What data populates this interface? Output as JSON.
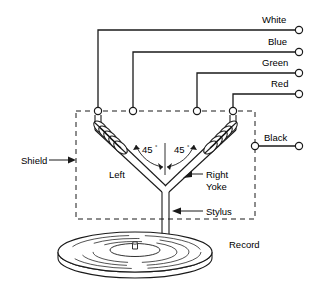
{
  "diagram": {
    "stroke_color": "#1a1a1a",
    "background_color": "#ffffff",
    "terminals": [
      {
        "name": "white-terminal",
        "label": "White",
        "label_x": 262,
        "label_y": 19,
        "wire_y": 30,
        "circle_x": 299,
        "tap_x": 98,
        "tap_y": 111
      },
      {
        "name": "blue-terminal",
        "label": "Blue",
        "label_x": 268,
        "label_y": 41,
        "wire_y": 52,
        "circle_x": 299,
        "tap_x": 133,
        "tap_y": 111
      },
      {
        "name": "green-terminal",
        "label": "Green",
        "label_x": 262,
        "label_y": 62,
        "wire_y": 73,
        "circle_x": 299,
        "tap_x": 197,
        "tap_y": 111
      },
      {
        "name": "red-terminal",
        "label": "Red",
        "label_x": 271,
        "label_y": 84,
        "wire_y": 94,
        "circle_x": 299,
        "tap_x": 233,
        "tap_y": 111
      },
      {
        "name": "black-terminal",
        "label": "Black",
        "label_x": 264,
        "label_y": 139,
        "wire_y": 146,
        "circle_x": 299,
        "tap_x": 255,
        "tap_y": 146
      }
    ],
    "callouts": [
      {
        "name": "shield-callout",
        "label": "Shield",
        "x": 20,
        "y": 163
      },
      {
        "name": "left-callout",
        "label": "Left",
        "x": 108,
        "y": 177
      },
      {
        "name": "right-callout",
        "label": "Right",
        "x": 206,
        "y": 177
      },
      {
        "name": "yoke-callout",
        "label": "Yoke",
        "x": 206,
        "y": 188
      },
      {
        "name": "stylus-callout",
        "label": "Stylus",
        "x": 206,
        "y": 214
      },
      {
        "name": "record-callout",
        "label": "Record",
        "x": 229,
        "y": 245
      }
    ],
    "angles": [
      {
        "name": "angle-left",
        "value": "45",
        "unit": "°",
        "x": 143,
        "y": 152
      },
      {
        "name": "angle-right",
        "value": "45",
        "unit": "°",
        "x": 175,
        "y": 152
      }
    ],
    "shield_box": {
      "name": "shield-dashed-box",
      "x": 76,
      "y": 111,
      "width": 179,
      "height": 108
    },
    "record": {
      "name": "record-disc",
      "cx": 135,
      "cy": 252,
      "rx": 77,
      "ry": 20,
      "thickness": 9
    },
    "stylus": {
      "name": "stylus-shaft",
      "x": 165,
      "top_y": 190,
      "tip_y": 243
    },
    "yoke": {
      "name": "yoke-v",
      "apex_x": 165,
      "apex_y": 190,
      "left_top_x": 98,
      "right_top_x": 233,
      "arm_top_y": 117
    }
  }
}
